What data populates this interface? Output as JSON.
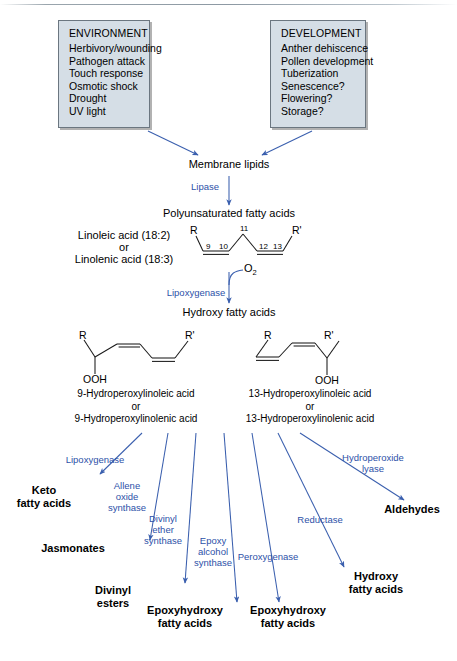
{
  "diagram": {
    "accent_enzyme_color": "#2d51a8",
    "box_fill": "#d5dee6",
    "box_border": "#6b7680",
    "arrow_color": "#3a5fae"
  },
  "inputs": [
    {
      "heading": "ENVIRONMENT",
      "items": [
        "Herbivory/wounding",
        "Pathogen attack",
        "Touch response",
        "Osmotic shock",
        "Drought",
        "UV light"
      ]
    },
    {
      "heading": "DEVELOPMENT",
      "items": [
        "Anther dehiscence",
        "Pollen development",
        "Tuberization",
        "Senescence?",
        "Flowering?",
        "Storage?"
      ]
    }
  ],
  "stages": {
    "membrane_lipids": "Membrane lipids",
    "lipase": "Lipase",
    "pufa": "Polyunsaturated fatty acids",
    "substrate_line1": "Linoleic acid (18:2)",
    "substrate_or": "or",
    "substrate_line3": "Linolenic acid (18:3)",
    "lipoxygenase": "Lipoxygenase",
    "oxygen": "O",
    "oxygen_sub": "2",
    "hydroxy_fatty_acids": "Hydroxy fatty acids"
  },
  "chain_labels": {
    "R": "R",
    "R_prime": "R'",
    "c9": "9",
    "c10": "10",
    "c11": "11",
    "c12": "12",
    "c13": "13",
    "ooh": "OOH"
  },
  "hydroperoxides": [
    {
      "name_line1": "9-Hydroperoxylinoleic acid",
      "name_or": "or",
      "name_line3": "9-Hydroperoxylinolenic acid"
    },
    {
      "name_line1": "13-Hydroperoxylinoleic acid",
      "name_or": "or",
      "name_line3": "13-Hydroperoxylinolenic acid"
    }
  ],
  "branches": [
    {
      "enzyme": "Lipoxygenase",
      "product": "Keto\nfatty acids"
    },
    {
      "enzyme": "Allene\noxide\nsynthase",
      "product": "Jasmonates"
    },
    {
      "enzyme": "Divinyl\nether\nsynthase",
      "product": "Divinyl\nesters"
    },
    {
      "enzyme": "Epoxy\nalcohol\nsynthase",
      "product": "Epoxyhydroxy\nfatty acids"
    },
    {
      "enzyme": "Peroxygenase",
      "product": "Epoxyhydroxy\nfatty acids"
    },
    {
      "enzyme": "Reductase",
      "product": "Hydroxy\nfatty acids"
    },
    {
      "enzyme": "Hydroperoxide\nlyase",
      "product": "Aldehydes"
    }
  ],
  "branch_text": {
    "b1_enzyme": "Lipoxygenase",
    "b1_product_l1": "Keto",
    "b1_product_l2": "fatty acids",
    "b2_enzyme_l1": "Allene",
    "b2_enzyme_l2": "oxide",
    "b2_enzyme_l3": "synthase",
    "b2_product": "Jasmonates",
    "b3_enzyme_l1": "Divinyl",
    "b3_enzyme_l2": "ether",
    "b3_enzyme_l3": "synthase",
    "b3_product_l1": "Divinyl",
    "b3_product_l2": "esters",
    "b4_enzyme_l1": "Epoxy",
    "b4_enzyme_l2": "alcohol",
    "b4_enzyme_l3": "synthase",
    "b4_product_l1": "Epoxyhydroxy",
    "b4_product_l2": "fatty acids",
    "b5_enzyme": "Peroxygenase",
    "b5_product_l1": "Epoxyhydroxy",
    "b5_product_l2": "fatty acids",
    "b6_enzyme": "Reductase",
    "b6_product_l1": "Hydroxy",
    "b6_product_l2": "fatty acids",
    "b7_enzyme_l1": "Hydroperoxide",
    "b7_enzyme_l2": "lyase",
    "b7_product": "Aldehydes"
  }
}
